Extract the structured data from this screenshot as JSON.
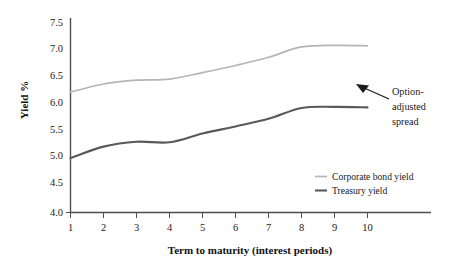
{
  "chart_data": {
    "type": "line",
    "title": "",
    "xlabel": "Term to maturity (interest periods)",
    "ylabel": "Yield %",
    "x": [
      1,
      2,
      3,
      4,
      5,
      6,
      7,
      8,
      9,
      10
    ],
    "xlim": [
      1,
      10
    ],
    "ylim": [
      4.0,
      7.5
    ],
    "grid": false,
    "legend_position": "center-right",
    "xticks": [
      "1",
      "2",
      "3",
      "4",
      "5",
      "6",
      "7",
      "8",
      "9",
      "10"
    ],
    "yticks": [
      "4.0",
      "4.5",
      "5.0",
      "5.5",
      "6.0",
      "6.5",
      "7.0",
      "7.5"
    ],
    "ytick_values": [
      4.0,
      4.5,
      5.0,
      5.5,
      6.0,
      6.5,
      7.0,
      7.5
    ],
    "series": [
      {
        "name": "Corporate bond yield",
        "color": "#b5b5b5",
        "values": [
          6.21,
          6.36,
          6.43,
          6.45,
          6.57,
          6.7,
          6.85,
          7.04,
          7.07,
          7.06
        ]
      },
      {
        "name": "Treasury yield",
        "color": "#595959",
        "values": [
          5.0,
          5.21,
          5.3,
          5.29,
          5.45,
          5.58,
          5.72,
          5.92,
          5.94,
          5.93
        ]
      }
    ],
    "annotations": [
      {
        "name": "option-adjusted-spread",
        "lines": [
          "Option-",
          "adjusted",
          "spread"
        ],
        "text": "Option-adjusted spread",
        "arrow_from": [
          389,
          99
        ],
        "arrow_to": [
          357,
          85
        ]
      }
    ]
  },
  "legend": {
    "items": [
      {
        "label": "Corporate bond yield",
        "color": "#b5b5b5"
      },
      {
        "label": "Treasury yield",
        "color": "#595959"
      }
    ]
  },
  "axes": {
    "x_title": "Term to maturity (interest periods)",
    "y_title": "Yield %"
  }
}
